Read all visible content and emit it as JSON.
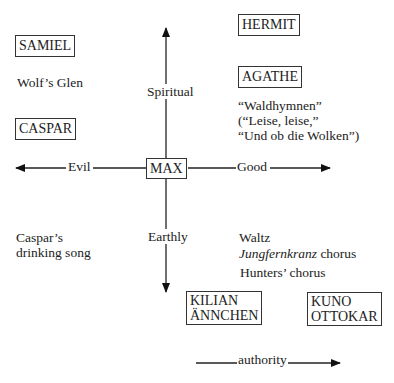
{
  "axes": {
    "vertical": {
      "up_label": "Spiritual",
      "down_label": "Earthly"
    },
    "horizontal": {
      "left_label": "Evil",
      "right_label": "Good"
    },
    "center": "MAX",
    "authority_label": "authority"
  },
  "characters": {
    "samiel": "SAMIEL",
    "caspar": "CASPAR",
    "hermit": "HERMIT",
    "agathe": "AGATHE",
    "kilian": "KILIAN",
    "annchen": "ÄNNCHEN",
    "kuno": "KUNO",
    "ottokar": "OTTOKAR"
  },
  "pieces": {
    "wolfs_glen": "Wolf’s Glen",
    "waldhymnen": {
      "line1": "“Waldhymnen”",
      "line2": "(“Leise, leise,”",
      "line3": "“Und ob die Wolken”)"
    },
    "caspars_song": {
      "line1": "Caspar’s",
      "line2": "drinking song"
    },
    "waltz": "Waltz",
    "jungfernkranz": {
      "italic": "Jungfernkranz",
      "rest": " chorus"
    },
    "hunters_chorus": "Hunters’ chorus"
  }
}
